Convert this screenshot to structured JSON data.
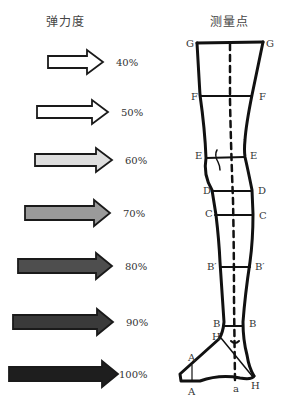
{
  "left_panel": {
    "title": "弹力度",
    "arrows": [
      {
        "label": "40%",
        "fill": "#ffffff"
      },
      {
        "label": "50%",
        "fill": "#ffffff"
      },
      {
        "label": "60%",
        "fill": "#dedede"
      },
      {
        "label": "70%",
        "fill": "#9a9a9a"
      },
      {
        "label": "80%",
        "fill": "#4e4e4e"
      },
      {
        "label": "90%",
        "fill": "#3a3a3a"
      },
      {
        "label": "100%",
        "fill": "#1e1e1e"
      }
    ]
  },
  "right_panel": {
    "title": "测量点",
    "points": {
      "G_left": "G",
      "G_right": "G",
      "F_left": "F",
      "F_right": "F",
      "E_left": "E",
      "E_right": "E",
      "D_left": "D",
      "D_right": "D",
      "C_left": "C",
      "C_right": "C",
      "B1_left": "B′",
      "B1_right": "B′",
      "B_left": "B",
      "B_right": "B",
      "H_left": "H",
      "H_right": "H",
      "A_top": "A",
      "A_bottom": "A",
      "a": "a"
    }
  }
}
